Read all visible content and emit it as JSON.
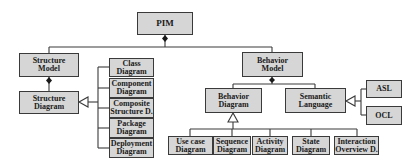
{
  "diagram": {
    "title": "PIM",
    "colors": {
      "node_fill": "#d6d6d6",
      "node_border": "#3a3a3a",
      "line": "#3a3a3a",
      "background": "#ffffff"
    },
    "nodes": {
      "pim": "PIM",
      "structure_model": "Structure\nModel",
      "structure_diagram": "Structure\nDiagram",
      "class_diagram": "Class\nDiagram",
      "component_diagram": "Component\nDiagram",
      "composite_structure": "Composite\nStructure D.",
      "package_diagram": "Package\nDiagram",
      "deployment_diagram": "Deployment\nDiagram",
      "behavior_model": "Behavior\nModel",
      "behavior_diagram": "Behavior\nDiagram",
      "semantic_language": "Semantic\nLanguage",
      "asl": "ASL",
      "ocl": "OCL",
      "use_case_diagram": "Use case\nDiagram",
      "sequence_diagram": "Sequence\nDiagram",
      "activity_diagram": "Activity\nDiagram",
      "state_diagram": "State\nDiagram",
      "interaction_overview": "Interaction\nOverview D."
    },
    "relations": [
      {
        "from": "PIM",
        "to": "Structure Model",
        "type": "composition"
      },
      {
        "from": "PIM",
        "to": "Behavior Model",
        "type": "composition"
      },
      {
        "from": "Structure Model",
        "to": "Structure Diagram",
        "type": "composition"
      },
      {
        "from": "Behavior Model",
        "to": "Behavior Diagram",
        "type": "composition"
      },
      {
        "from": "Behavior Model",
        "to": "Semantic Language",
        "type": "composition"
      },
      {
        "from": "Class Diagram",
        "to": "Structure Diagram",
        "type": "generalization"
      },
      {
        "from": "Component Diagram",
        "to": "Structure Diagram",
        "type": "generalization"
      },
      {
        "from": "Composite Structure D.",
        "to": "Structure Diagram",
        "type": "generalization"
      },
      {
        "from": "Package Diagram",
        "to": "Structure Diagram",
        "type": "generalization"
      },
      {
        "from": "Deployment Diagram",
        "to": "Structure Diagram",
        "type": "generalization"
      },
      {
        "from": "Use case Diagram",
        "to": "Behavior Diagram",
        "type": "generalization"
      },
      {
        "from": "Sequence Diagram",
        "to": "Behavior Diagram",
        "type": "generalization"
      },
      {
        "from": "Activity Diagram",
        "to": "Behavior Diagram",
        "type": "generalization"
      },
      {
        "from": "State Diagram",
        "to": "Behavior Diagram",
        "type": "generalization"
      },
      {
        "from": "Interaction Overview D.",
        "to": "Behavior Diagram",
        "type": "generalization"
      },
      {
        "from": "ASL",
        "to": "Semantic Language",
        "type": "generalization"
      },
      {
        "from": "OCL",
        "to": "Semantic Language",
        "type": "generalization"
      }
    ]
  }
}
